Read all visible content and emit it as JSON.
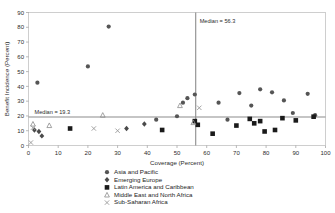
{
  "chart_data": {
    "type": "scatter",
    "title": "",
    "xlabel": "Coverage (Percent)",
    "ylabel": "Benefit Incidence (Percent)",
    "xlim": [
      0,
      100
    ],
    "ylim": [
      0,
      90
    ],
    "xticks": [
      0,
      10,
      20,
      30,
      40,
      50,
      60,
      70,
      80,
      90,
      100
    ],
    "yticks": [
      0,
      10,
      20,
      30,
      40,
      50,
      60,
      70,
      80,
      90
    ],
    "grid": false,
    "legend_position": "bottom-center",
    "annotations": [
      {
        "name": "median-x",
        "text": "Median = 56.3",
        "value": 56.3,
        "orientation": "vertical"
      },
      {
        "name": "median-y",
        "text": "Median = 19.3",
        "value": 19.3,
        "orientation": "horizontal"
      }
    ],
    "series": [
      {
        "name": "Asia and Pacific",
        "marker": "circle",
        "color": "#555555",
        "points": [
          [
            3.0,
            42.5
          ],
          [
            20.0,
            53.5
          ],
          [
            27.0,
            80.5
          ],
          [
            43.0,
            17.5
          ],
          [
            50.0,
            19.8
          ],
          [
            52.0,
            29.0
          ],
          [
            53.5,
            32.0
          ],
          [
            56.0,
            34.5
          ],
          [
            64.0,
            29.0
          ],
          [
            67.0,
            17.5
          ],
          [
            71.0,
            35.5
          ],
          [
            75.0,
            27.0
          ],
          [
            78.0,
            38.0
          ],
          [
            82.0,
            36.0
          ],
          [
            86.0,
            30.5
          ],
          [
            89.0,
            22.0
          ],
          [
            94.0,
            35.0
          ],
          [
            96.5,
            20.5
          ]
        ]
      },
      {
        "name": "Emerging Europe",
        "marker": "diamond",
        "color": "#4a4a4a",
        "points": [
          [
            2.0,
            10.5
          ],
          [
            3.5,
            9.5
          ],
          [
            4.5,
            6.5
          ],
          [
            33.0,
            11.5
          ],
          [
            39.0,
            14.5
          ]
        ]
      },
      {
        "name": "Latin America and Caribbean",
        "marker": "square",
        "color": "#1a1a1a",
        "points": [
          [
            14.0,
            11.5
          ],
          [
            45.0,
            10.5
          ],
          [
            56.0,
            16.5
          ],
          [
            57.0,
            14.0
          ],
          [
            62.0,
            8.0
          ],
          [
            70.0,
            13.5
          ],
          [
            74.5,
            18.0
          ],
          [
            76.0,
            15.0
          ],
          [
            78.0,
            16.5
          ],
          [
            79.5,
            9.5
          ],
          [
            83.0,
            10.5
          ],
          [
            85.5,
            18.5
          ],
          [
            90.0,
            17.0
          ],
          [
            96.0,
            19.5
          ]
        ]
      },
      {
        "name": "Middle East and North Africa",
        "marker": "triangle",
        "color": "#8d8d8d",
        "points": [
          [
            1.5,
            14.5
          ],
          [
            7.0,
            13.5
          ],
          [
            25.0,
            20.5
          ],
          [
            51.0,
            27.0
          ],
          [
            55.5,
            15.5
          ]
        ]
      },
      {
        "name": "Sub-Saharan Africa",
        "marker": "cross",
        "color": "#9a9a9a",
        "points": [
          [
            0.8,
            2.0
          ],
          [
            1.5,
            12.0
          ],
          [
            22.0,
            11.5
          ],
          [
            30.0,
            10.0
          ],
          [
            57.5,
            25.5
          ]
        ]
      }
    ]
  },
  "legend": {
    "items": [
      {
        "label": "Asia and Pacific",
        "marker": "circle"
      },
      {
        "label": "Emerging Europe",
        "marker": "diamond"
      },
      {
        "label": "Latin America and Caribbean",
        "marker": "square"
      },
      {
        "label": "Middle East and North Africa",
        "marker": "triangle"
      },
      {
        "label": "Sub-Saharan Africa",
        "marker": "cross"
      }
    ]
  }
}
